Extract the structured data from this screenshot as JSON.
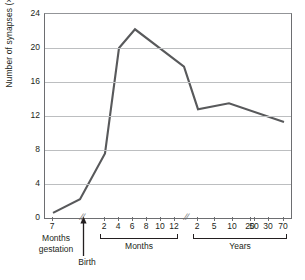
{
  "chart_data": {
    "type": "line",
    "title": "",
    "subtitle": "",
    "xlabel": "",
    "ylabel": "Number of synapses (×10",
    "ylabel_exponent": "11",
    "ylabel_suffix": ")",
    "ylim": [
      0,
      24
    ],
    "yticks": [
      0,
      4,
      8,
      12,
      16,
      20,
      24
    ],
    "grid": true,
    "legend": null,
    "legend_position": "none",
    "line_color": "#58595b",
    "axis_color": "#6d6e71",
    "grid_color": "#bcbec0",
    "axis_breaks": [
      "after 7 months gestation",
      "after 12 months"
    ],
    "x_segments": [
      {
        "name": "Months gestation",
        "group_label": "Months\ngestation",
        "group_label_line1": "Months",
        "group_label_line2": "gestation",
        "has_bracket": false,
        "ticks": [
          {
            "label": "7",
            "x_px": 8
          }
        ]
      },
      {
        "name": "Months",
        "group_label": "Months",
        "has_bracket": true,
        "ticks": [
          {
            "label": "2",
            "x_px": 60
          },
          {
            "label": "4",
            "x_px": 74
          },
          {
            "label": "6",
            "x_px": 88
          },
          {
            "label": "8",
            "x_px": 102
          },
          {
            "label": "10",
            "x_px": 116
          },
          {
            "label": "12",
            "x_px": 130
          }
        ]
      },
      {
        "name": "Years",
        "group_label": "Years",
        "has_bracket": true,
        "ticks": [
          {
            "label": "2",
            "x_px": 153
          },
          {
            "label": "5",
            "x_px": 170
          },
          {
            "label": "10",
            "x_px": 188
          },
          {
            "label": "20",
            "x_px": 206
          },
          {
            "label": "30",
            "x_px": 224
          },
          {
            "label": "50",
            "x_px": 210
          },
          {
            "label": "70",
            "x_px": 239
          }
        ]
      }
    ],
    "annotations": [
      {
        "name": "birth-marker",
        "label": "Birth",
        "type": "arrow-up",
        "x_px": 39
      }
    ],
    "series": [
      {
        "name": "Number of synapses",
        "points": [
          {
            "x_label": "7 months gestation",
            "x_px": 8,
            "y": 0.6
          },
          {
            "x_label": "Birth",
            "x_px": 35,
            "y": 2.2
          },
          {
            "x_label": "2 months",
            "x_px": 60,
            "y": 7.6
          },
          {
            "x_label": "4 months",
            "x_px": 74,
            "y": 20.0
          },
          {
            "x_label": "8 months",
            "x_px": 90,
            "y": 22.2
          },
          {
            "x_label": "2 years",
            "x_px": 139,
            "y": 17.8
          },
          {
            "x_label": "10 years",
            "x_px": 153,
            "y": 12.8
          },
          {
            "x_label": "25 years",
            "x_px": 184,
            "y": 13.5
          },
          {
            "x_label": "70 years",
            "x_px": 239,
            "y": 11.3
          }
        ]
      }
    ]
  }
}
